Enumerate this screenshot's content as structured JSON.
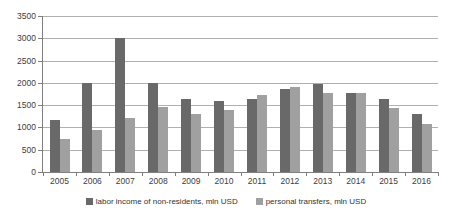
{
  "chart_data": {
    "type": "bar",
    "title": "",
    "categories": [
      "2005",
      "2006",
      "2007",
      "2008",
      "2009",
      "2010",
      "2011",
      "2012",
      "2013",
      "2014",
      "2015",
      "2016"
    ],
    "series": [
      {
        "name": "labor income of non-residents, mln USD",
        "color": "#696969",
        "values": [
          1160,
          2000,
          3000,
          2000,
          1630,
          1590,
          1650,
          1860,
          1980,
          1780,
          1640,
          1300
        ]
      },
      {
        "name": "personal transfers, mln USD",
        "color": "#a0a0a0",
        "values": [
          740,
          950,
          1210,
          1450,
          1310,
          1400,
          1720,
          1910,
          1780,
          1780,
          1440,
          1080
        ]
      }
    ],
    "xlabel": "",
    "ylabel": "",
    "ylim": [
      0,
      3500
    ],
    "yticks": [
      0,
      500,
      1000,
      1500,
      2000,
      2500,
      3000,
      3500
    ],
    "grid": true,
    "legend_position": "bottom"
  },
  "colors": {
    "background": "#ffffff",
    "gridline": "#b0b0b0",
    "axis": "#7f7f7f",
    "text": "#404040"
  }
}
